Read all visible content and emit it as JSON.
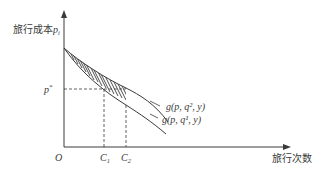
{
  "diagram": {
    "y_axis_label": "旅行成本",
    "y_axis_var": "p",
    "y_axis_var_sub": "i",
    "x_axis_label": "旅行次数",
    "origin_label": "O",
    "price_label": "p",
    "price_label_sup": "*",
    "c1_label": "C",
    "c1_sub": "1",
    "c2_label": "C",
    "c2_sub": "2",
    "curve_upper_label": "g(p, q², y)",
    "curve_lower_label": "g(p, q¹, y)",
    "colors": {
      "line": "#3a3a3a",
      "background": "#ffffff"
    }
  }
}
